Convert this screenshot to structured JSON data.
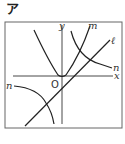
{
  "figure": {
    "tag": "ア",
    "axes": {
      "x_label": "x",
      "y_label": "y",
      "origin_label": "O"
    },
    "curves": {
      "l_label": "ℓ",
      "m_label": "m",
      "n_label_right": "n",
      "n_label_left": "n"
    },
    "colors": {
      "stroke": "#222222",
      "frame": "#555555",
      "background": "#ffffff"
    }
  }
}
